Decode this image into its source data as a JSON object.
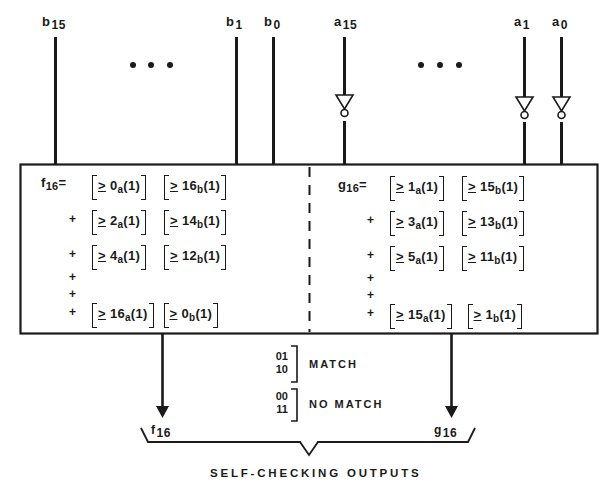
{
  "inputs": {
    "b": [
      {
        "name": "b",
        "index": "15",
        "x": 55
      },
      {
        "name": "b",
        "index": "1",
        "x": 236
      },
      {
        "name": "b",
        "index": "0",
        "x": 273
      }
    ],
    "a": [
      {
        "name": "a",
        "index": "15",
        "x": 344
      },
      {
        "name": "a",
        "index": "1",
        "x": 524
      },
      {
        "name": "a",
        "index": "0",
        "x": 561
      }
    ],
    "ellipsis": "• • •"
  },
  "left_block": {
    "lhs": "f",
    "lhs_sub": "16",
    "equals": "=",
    "terms": [
      {
        "prefix": "",
        "a_threshold": "0",
        "b_threshold": "16"
      },
      {
        "prefix": "+",
        "a_threshold": "2",
        "b_threshold": "14"
      },
      {
        "prefix": "+",
        "a_threshold": "4",
        "b_threshold": "12"
      },
      {
        "prefix": "+",
        "a_threshold": "16",
        "b_threshold": "0"
      }
    ],
    "continuation": [
      "+",
      "+"
    ]
  },
  "right_block": {
    "lhs": "g",
    "lhs_sub": "16",
    "equals": "=",
    "terms": [
      {
        "prefix": "",
        "a_threshold": "1",
        "b_threshold": "15"
      },
      {
        "prefix": "+",
        "a_threshold": "3",
        "b_threshold": "13"
      },
      {
        "prefix": "+",
        "a_threshold": "5",
        "b_threshold": "11"
      },
      {
        "prefix": "+",
        "a_threshold": "15",
        "b_threshold": "1"
      }
    ],
    "continuation": [
      "+",
      "+"
    ]
  },
  "term_format": {
    "ge_symbol": ">",
    "a_sub": "a",
    "b_sub": "b",
    "arg": "(1)"
  },
  "outputs": {
    "f": {
      "name": "f",
      "sub": "16"
    },
    "g": {
      "name": "g",
      "sub": "16"
    }
  },
  "legend": {
    "match_codes": [
      "01",
      "10"
    ],
    "match_label": "MATCH",
    "nomatch_codes": [
      "00",
      "11"
    ],
    "nomatch_label": "NO MATCH"
  },
  "caption": "SELF-CHECKING OUTPUTS",
  "colors": {
    "ink": "#1a1a1a",
    "background": "#ffffff"
  }
}
